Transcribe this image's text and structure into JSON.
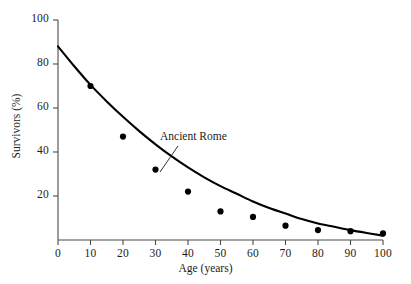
{
  "chart_data": {
    "type": "scatter",
    "title": "",
    "xlabel": "Age (years)",
    "ylabel": "Survivors (%)",
    "xlim": [
      0,
      100
    ],
    "ylim": [
      0,
      100
    ],
    "xticks": [
      0,
      10,
      20,
      30,
      40,
      50,
      60,
      70,
      80,
      90,
      100
    ],
    "xtick_labels": [
      "0",
      "10",
      "20",
      "30",
      "40",
      "50",
      "60",
      "70",
      "80",
      "90",
      "100"
    ],
    "yticks": [
      20,
      40,
      60,
      80,
      100
    ],
    "ytick_labels": [
      "20",
      "40",
      "60",
      "80",
      "100"
    ],
    "grid": false,
    "legend_position": "inline-annotation",
    "annotations": [
      {
        "text": "Ancient Rome",
        "points_to_x": 35,
        "points_to_y": 27
      }
    ],
    "series": [
      {
        "name": "Ancient Rome",
        "style": "points",
        "marker": "filled-circle",
        "color": "#000000",
        "x": [
          10,
          20,
          30,
          40,
          50,
          60,
          70,
          80,
          90,
          100
        ],
        "values": [
          70,
          47,
          32,
          22,
          13,
          10.5,
          6.5,
          4.5,
          4,
          3
        ]
      },
      {
        "name": "Fitted survivorship curve",
        "style": "line",
        "color": "#000000",
        "x": [
          0,
          5,
          10,
          15,
          20,
          25,
          30,
          35,
          40,
          45,
          50,
          55,
          60,
          65,
          70,
          75,
          80,
          85,
          90,
          95,
          100
        ],
        "values": [
          88,
          79,
          70.5,
          63,
          56,
          49.5,
          43.5,
          38,
          33,
          28.5,
          24.5,
          21,
          17.5,
          14.5,
          12,
          9.5,
          7.5,
          6,
          4.5,
          3.2,
          2
        ]
      }
    ]
  },
  "axis": {
    "x_label": "Age (years)",
    "y_label": "Survivors (%)"
  }
}
